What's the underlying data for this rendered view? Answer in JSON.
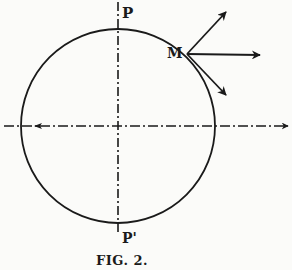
{
  "figure": {
    "caption": "FIG. 2.",
    "labels": {
      "top_pole": "P",
      "point": "M",
      "bottom_pole": "P'"
    },
    "circle": {
      "cx": 118,
      "cy": 126,
      "r": 97
    },
    "axes": {
      "vertical": {
        "style": "dash-dot",
        "x": 118,
        "y1": 2,
        "y2": 232
      },
      "horizontal": {
        "style": "dash-dot",
        "y": 126,
        "x1": 4,
        "x2": 288,
        "arrow": "right"
      }
    },
    "point_m": {
      "x": 187,
      "y": 54
    },
    "vectors": [
      {
        "name": "upward-oblique",
        "to": [
          226,
          12
        ]
      },
      {
        "name": "horizontal",
        "to": [
          260,
          55
        ]
      },
      {
        "name": "downward-oblique",
        "to": [
          226,
          95
        ]
      }
    ],
    "colors": {
      "ink": "#1a1a1a",
      "paper": "#fbfbf9"
    }
  }
}
